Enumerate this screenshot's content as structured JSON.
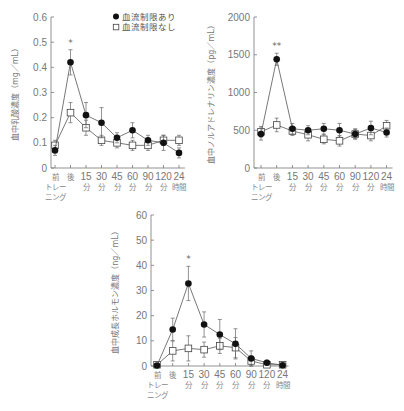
{
  "legend": {
    "filled": "血流制限あり",
    "open": "血流制限なし"
  },
  "x_categories": [
    [
      "前",
      "トレー",
      "ニング"
    ],
    [
      "後"
    ],
    [
      "15",
      "分"
    ],
    [
      "30",
      "分"
    ],
    [
      "45",
      "分"
    ],
    [
      "60",
      "分"
    ],
    [
      "90",
      "分"
    ],
    [
      "120",
      "分"
    ],
    [
      "24",
      "時間"
    ]
  ],
  "chart_data": [
    {
      "type": "line",
      "title": "",
      "xlabel": "",
      "ylabel": "血中乳酸濃度（mg／mL）",
      "categories": [
        "前トレーニング",
        "後",
        "15分",
        "30分",
        "45分",
        "60分",
        "90分",
        "120分",
        "24時間"
      ],
      "ylim": [
        0,
        0.6
      ],
      "yticks": [
        "0",
        "0.1",
        "0.2",
        "0.3",
        "0.4",
        "0.5",
        "0.6"
      ],
      "grid": false,
      "legend_position": "top-right",
      "annotations": [
        {
          "category": "後",
          "text": "*"
        }
      ],
      "series": [
        {
          "name": "血流制限あり",
          "marker": "filled-circle",
          "values": [
            0.07,
            0.42,
            0.21,
            0.18,
            0.12,
            0.15,
            0.11,
            0.1,
            0.06
          ],
          "errors": [
            0.02,
            0.05,
            0.05,
            0.06,
            0.02,
            0.03,
            0.02,
            0.03,
            0.02
          ]
        },
        {
          "name": "血流制限なし",
          "marker": "open-square",
          "values": [
            0.09,
            0.22,
            0.16,
            0.11,
            0.1,
            0.09,
            0.09,
            0.11,
            0.11
          ],
          "errors": [
            0.02,
            0.04,
            0.03,
            0.02,
            0.02,
            0.02,
            0.02,
            0.02,
            0.02
          ]
        }
      ]
    },
    {
      "type": "line",
      "title": "",
      "xlabel": "",
      "ylabel": "血中ノルアドレナリン濃度（pg／mL）",
      "categories": [
        "前トレーニング",
        "後",
        "15分",
        "30分",
        "45分",
        "60分",
        "90分",
        "120分",
        "24時間"
      ],
      "ylim": [
        0,
        2000
      ],
      "yticks": [
        "0",
        "500",
        "1000",
        "1500",
        "2000"
      ],
      "grid": false,
      "annotations": [
        {
          "category": "後",
          "text": "**"
        }
      ],
      "series": [
        {
          "name": "血流制限あり",
          "marker": "filled-circle",
          "values": [
            450,
            1440,
            520,
            500,
            520,
            500,
            450,
            530,
            470
          ],
          "errors": [
            80,
            80,
            70,
            60,
            70,
            90,
            60,
            90,
            60
          ]
        },
        {
          "name": "血流制限なし",
          "marker": "open-square",
          "values": [
            480,
            570,
            490,
            440,
            380,
            360,
            450,
            430,
            560
          ],
          "errors": [
            70,
            90,
            60,
            80,
            60,
            70,
            70,
            70,
            70
          ]
        }
      ]
    },
    {
      "type": "line",
      "title": "",
      "xlabel": "",
      "ylabel": "血中成長ホルモン濃度（ng／mL）",
      "categories": [
        "前トレーニング",
        "後",
        "15分",
        "30分",
        "45分",
        "60分",
        "90分",
        "120分",
        "24時間"
      ],
      "ylim": [
        0,
        60
      ],
      "yticks": [
        "0",
        "10",
        "20",
        "30",
        "40",
        "50",
        "60"
      ],
      "grid": false,
      "annotations": [
        {
          "category": "15分",
          "text": "*"
        }
      ],
      "series": [
        {
          "name": "血流制限あり",
          "marker": "filled-circle",
          "values": [
            0.2,
            14.5,
            32.8,
            16.5,
            12.5,
            8.8,
            3.0,
            1.3,
            0.3
          ],
          "errors": [
            0.3,
            4.5,
            6.8,
            5.0,
            6.0,
            6.0,
            3.0,
            1.0,
            0.3
          ]
        },
        {
          "name": "血流制限なし",
          "marker": "open-square",
          "values": [
            0.5,
            6.0,
            7.0,
            6.5,
            8.0,
            7.3,
            2.0,
            0.5,
            0.5
          ],
          "errors": [
            0.5,
            4.0,
            5.0,
            3.0,
            3.0,
            4.0,
            2.0,
            0.5,
            0.3
          ]
        }
      ]
    }
  ]
}
